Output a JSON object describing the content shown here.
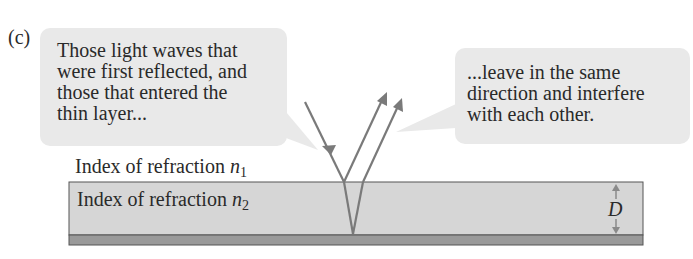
{
  "figure": {
    "panel_label": "(c)",
    "callouts": {
      "left": {
        "lines": [
          "Those light waves that",
          "were first reflected, and",
          "those that entered the",
          "thin layer..."
        ]
      },
      "right": {
        "lines": [
          "...leave in the same",
          "direction and interfere",
          "with each other."
        ]
      }
    },
    "medium_1": {
      "label": "Index of refraction",
      "symbol": "n",
      "subscript": "1"
    },
    "medium_2": {
      "label": "Index of refraction",
      "symbol": "n",
      "subscript": "2"
    },
    "thickness": {
      "symbol": "D"
    },
    "colors": {
      "callout_bg": "#e9e9e9",
      "layer_fill": "#d6d6d6",
      "substrate_fill": "#9a9a9a",
      "ray": "#7a7a7a",
      "arrow_dim": "#8a8a8a"
    }
  }
}
